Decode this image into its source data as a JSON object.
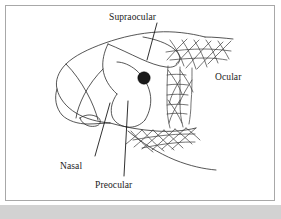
{
  "figure": {
    "kind": "line-drawing",
    "frame": {
      "border_color": "#a8a8a8",
      "background_color": "#ffffff",
      "bottom_band_color": "#d2d2d2"
    },
    "ink_color": "#2b2b2b",
    "labels": [
      {
        "id": "supraocular",
        "text": "Supraocular"
      },
      {
        "id": "ocular",
        "text": "Ocular"
      },
      {
        "id": "nasal",
        "text": "Nasal"
      },
      {
        "id": "preocular",
        "text": "Preocular"
      }
    ],
    "marks": {
      "eye_spot": "filled-dark-circle"
    }
  }
}
